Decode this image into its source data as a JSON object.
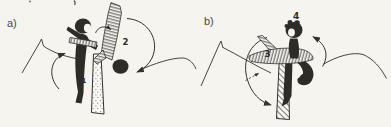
{
  "figure": {
    "panel_a": {
      "label": "a)",
      "steps": {
        "s1": "1",
        "s2": "2"
      }
    },
    "panel_b": {
      "label": "b)",
      "steps": {
        "s3": "3",
        "s4": "4"
      }
    }
  },
  "colors": {
    "paper": "#f5f4ef",
    "ink": "#33312c"
  }
}
